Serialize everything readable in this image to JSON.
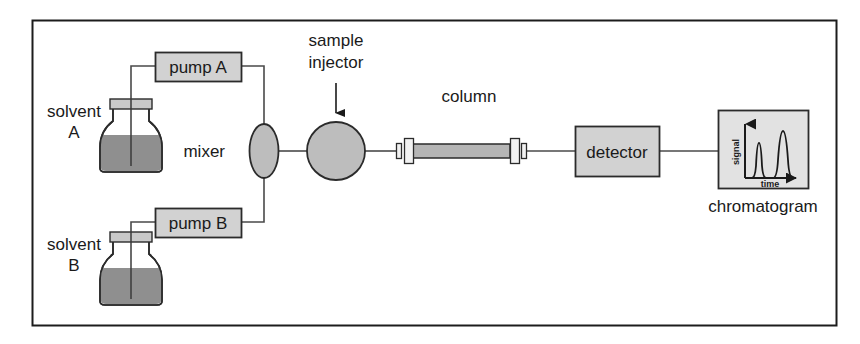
{
  "figure": {
    "frame": {
      "border_color": "#1c1c1c",
      "background": "#ffffff"
    }
  },
  "colors": {
    "outline": "#2b2b2b",
    "box_fill": "#d2d2d2",
    "component_fill": "#bdbdbd",
    "liquid_fill": "#8f8f8f",
    "panel_fill": "#e2e2e2",
    "line": "#4a4a4a",
    "text": "#1a1a1a"
  },
  "labels": {
    "solvent_a": "solvent",
    "solvent_a_sub": "A",
    "solvent_b": "solvent",
    "solvent_b_sub": "B",
    "pump_a": "pump A",
    "pump_b": "pump B",
    "mixer": "mixer",
    "sample_injector_line1": "sample",
    "sample_injector_line2": "injector",
    "column": "column",
    "detector": "detector",
    "chromatogram": "chromatogram"
  },
  "chromatogram": {
    "y_axis_label": "signal",
    "x_axis_label": "time",
    "peak_count": 2,
    "peaks": [
      {
        "name": "peak-1",
        "retention_relative": 0.33,
        "height_relative": 0.62,
        "width_relative": 0.14
      },
      {
        "name": "peak-2",
        "retention_relative": 0.68,
        "height_relative": 0.92,
        "width_relative": 0.19
      }
    ]
  },
  "components": [
    {
      "name": "solvent-bottle-a",
      "type": "reservoir",
      "fill_level": 0.6
    },
    {
      "name": "solvent-bottle-b",
      "type": "reservoir",
      "fill_level": 0.6
    },
    {
      "name": "pump-a",
      "type": "box"
    },
    {
      "name": "pump-b",
      "type": "box"
    },
    {
      "name": "mixer",
      "type": "ellipse"
    },
    {
      "name": "sample-injector",
      "type": "circle"
    },
    {
      "name": "column",
      "type": "tube",
      "fittings": 2
    },
    {
      "name": "detector",
      "type": "box"
    },
    {
      "name": "chromatogram-panel",
      "type": "plot"
    }
  ]
}
